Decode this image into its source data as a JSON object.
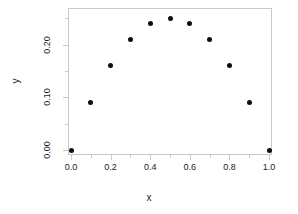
{
  "chart_data": {
    "type": "scatter",
    "title": "",
    "xlabel": "x",
    "ylabel": "y",
    "x": [
      0.0,
      0.1,
      0.2,
      0.3,
      0.4,
      0.5,
      0.6,
      0.7,
      0.8,
      0.9,
      1.0
    ],
    "values": [
      0.0,
      0.09,
      0.16,
      0.21,
      0.24,
      0.25,
      0.24,
      0.21,
      0.16,
      0.09,
      0.0
    ],
    "xlim": [
      0.0,
      1.0
    ],
    "ylim": [
      0.0,
      0.26
    ],
    "x_ticks": [
      {
        "value": 0.0,
        "label": "0.0",
        "major": true
      },
      {
        "value": 0.1,
        "label": "",
        "major": false
      },
      {
        "value": 0.2,
        "label": "0.2",
        "major": true
      },
      {
        "value": 0.3,
        "label": "",
        "major": false
      },
      {
        "value": 0.4,
        "label": "0.4",
        "major": true
      },
      {
        "value": 0.5,
        "label": "",
        "major": false
      },
      {
        "value": 0.6,
        "label": "0.6",
        "major": true
      },
      {
        "value": 0.7,
        "label": "",
        "major": false
      },
      {
        "value": 0.8,
        "label": "0.8",
        "major": true
      },
      {
        "value": 0.9,
        "label": "",
        "major": false
      },
      {
        "value": 1.0,
        "label": "1.0",
        "major": true
      }
    ],
    "y_ticks": [
      {
        "value": 0.0,
        "label": "0.00",
        "major": true
      },
      {
        "value": 0.05,
        "label": "",
        "major": false
      },
      {
        "value": 0.1,
        "label": "0.10",
        "major": true
      },
      {
        "value": 0.15,
        "label": "",
        "major": false
      },
      {
        "value": 0.2,
        "label": "0.20",
        "major": true
      },
      {
        "value": 0.25,
        "label": "",
        "major": false
      }
    ],
    "grid": false,
    "legend": null,
    "point_color": "#0d0d0d",
    "axis_color": "#c9c9c9",
    "background": "#ffffff"
  }
}
